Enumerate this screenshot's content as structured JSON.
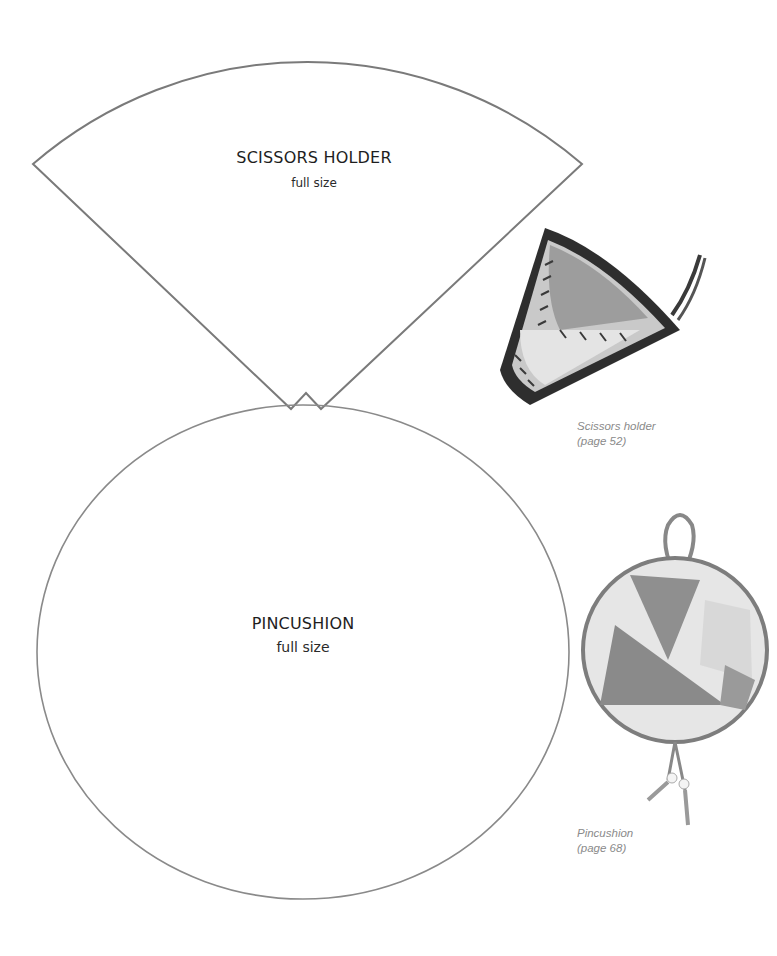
{
  "templates": {
    "scissors_holder": {
      "title": "SCISSORS HOLDER",
      "subtitle": "full size"
    },
    "pincushion": {
      "title": "PINCUSHION",
      "subtitle": "full size"
    }
  },
  "photos": {
    "scissors_holder": {
      "caption_line1": "Scissors holder",
      "caption_line2": "(page 52)"
    },
    "pincushion": {
      "caption_line1": "Pincushion",
      "caption_line2": "(page 68)"
    }
  },
  "colors": {
    "outline": "#7a7a7a",
    "caption": "#8a8a8a",
    "text": "#1e1e1e"
  }
}
